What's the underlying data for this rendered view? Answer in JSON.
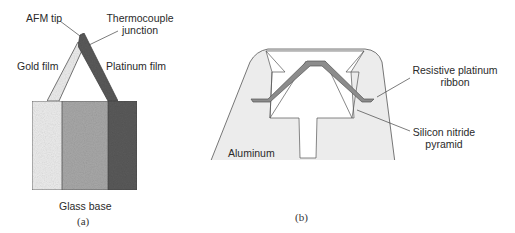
{
  "panel_a": {
    "caption": "(a)",
    "labels": {
      "afm_tip": "AFM tip",
      "thermocouple_line1": "Thermocouple",
      "thermocouple_line2": "junction",
      "gold_film": "Gold film",
      "platinum_film": "Platinum film",
      "glass_base": "Glass base"
    },
    "colors": {
      "gold_film": "#ececec",
      "glass_base": "#a8a8a8",
      "platinum_film": "#5a5a5a",
      "outline": "#555555"
    }
  },
  "panel_b": {
    "caption": "(b)",
    "labels": {
      "ribbon_line1": "Resistive platinum",
      "ribbon_line2": "ribbon",
      "pyramid_line1": "Silicon nitride",
      "pyramid_line2": "pyramid",
      "aluminum": "Aluminum"
    },
    "colors": {
      "aluminum": "#ececec",
      "ribbon": "#8c8c8c",
      "pyramid": "#ffffff",
      "outline": "#555555"
    }
  }
}
